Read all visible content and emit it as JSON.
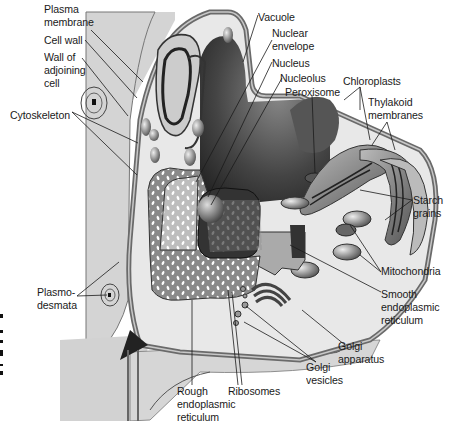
{
  "diagram": {
    "labels": [
      {
        "id": "plasma-membrane",
        "text": "Plasma\nmembrane",
        "x": 44,
        "y": 3
      },
      {
        "id": "cell-wall",
        "text": "Cell wall",
        "x": 44,
        "y": 34
      },
      {
        "id": "wall-of-adjoining-cell",
        "text": "Wall of\nadjoining\ncell",
        "x": 44,
        "y": 51
      },
      {
        "id": "cytoskeleton",
        "text": "Cytoskeleton",
        "x": 10,
        "y": 109
      },
      {
        "id": "vacuole",
        "text": "Vacuole",
        "x": 258,
        "y": 11
      },
      {
        "id": "nuclear-envelope",
        "text": "Nuclear\nenvelope",
        "x": 272,
        "y": 27
      },
      {
        "id": "nucleus",
        "text": "Nucleus",
        "x": 272,
        "y": 57
      },
      {
        "id": "nucleolus",
        "text": "Nucleolus",
        "x": 280,
        "y": 72
      },
      {
        "id": "peroxisome",
        "text": "Peroxisome",
        "x": 285,
        "y": 86
      },
      {
        "id": "chloroplasts",
        "text": "Chloroplasts",
        "x": 343,
        "y": 75
      },
      {
        "id": "thylakoid-membranes",
        "text": "Thylakoid\nmembranes",
        "x": 368,
        "y": 96
      },
      {
        "id": "starch-grains",
        "text": "Starch\ngrains",
        "x": 413,
        "y": 194
      },
      {
        "id": "mitochondria",
        "text": "Mitochondria",
        "x": 381,
        "y": 265
      },
      {
        "id": "smooth-er",
        "text": "Smooth\nendoplasmic\nreticulum",
        "x": 381,
        "y": 288
      },
      {
        "id": "plasmodesmata",
        "text": "Plasmo-\ndesmata",
        "x": 37,
        "y": 286
      },
      {
        "id": "golgi-apparatus",
        "text": "Golgi\napparatus",
        "x": 338,
        "y": 340
      },
      {
        "id": "golgi-vesicles",
        "text": "Golgi\nvesicles",
        "x": 306,
        "y": 361
      },
      {
        "id": "rough-er",
        "text": "Rough\nendoplasmic\nreticulum",
        "x": 177,
        "y": 385
      },
      {
        "id": "ribosomes",
        "text": "Ribosomes",
        "x": 228,
        "y": 385
      }
    ],
    "colors": {
      "background": "#ffffff",
      "outside_fill": "#d6d6d6",
      "cytoplasm": "#e9e9e9",
      "wall": "#9a9a9a",
      "dark": "#2b2b2b",
      "vacuole": "#4a4a4a",
      "leader_line": "#1a1a1a"
    }
  }
}
